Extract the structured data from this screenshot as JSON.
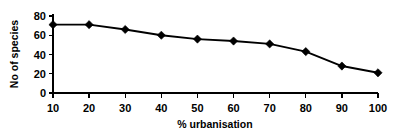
{
  "chart_data": {
    "type": "line",
    "title": "",
    "xlabel": "% urbanisation",
    "ylabel": "No of species",
    "x": [
      10,
      20,
      30,
      40,
      50,
      60,
      70,
      80,
      90,
      100
    ],
    "values": [
      71,
      71,
      66,
      60,
      56,
      54,
      51,
      43,
      28,
      21
    ],
    "categories": [
      "10",
      "20",
      "30",
      "40",
      "50",
      "60",
      "70",
      "80",
      "90",
      "100"
    ],
    "xtick_labels": [
      "10",
      "20",
      "30",
      "40",
      "50",
      "60",
      "70",
      "80",
      "90",
      "100"
    ],
    "ytick_labels": [
      "0",
      "20",
      "40",
      "60",
      "80"
    ],
    "yticks": [
      0,
      20,
      40,
      60,
      80
    ],
    "xlim": [
      10,
      100
    ],
    "ylim": [
      0,
      80
    ],
    "grid": false,
    "legend": false,
    "marker": "diamond",
    "line_color": "#000000",
    "marker_color": "#000000",
    "background_color": "#ffffff",
    "series": [
      {
        "name": "No of species",
        "values": [
          71,
          71,
          66,
          60,
          56,
          54,
          51,
          43,
          28,
          21
        ]
      }
    ]
  }
}
